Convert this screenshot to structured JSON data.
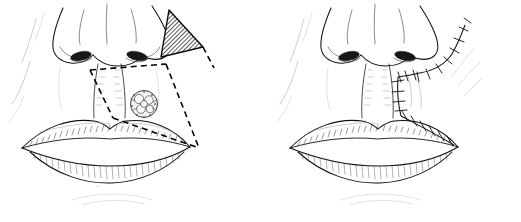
{
  "figure": {
    "type": "medical-surgical-illustration",
    "style": "black-and-white pen-and-ink line drawing",
    "background_color": "#ffffff",
    "ink_color": "#111111",
    "panel_count": 2,
    "dimensions": {
      "width": 521,
      "height": 222
    }
  },
  "panels": [
    {
      "id": "left",
      "label": "preoperative-plan",
      "caption": "",
      "description": "Frontal view of nose and lips with planned excision marked by dashed lines and a cross-hatched triangular flap",
      "anatomy": {
        "nose": "nasal tip, alae and columella with nostrils",
        "lips": "upper and lower vermillion with philtrum",
        "cheek": "right nasolabial fold"
      },
      "annotations": [
        {
          "name": "lesion",
          "kind": "skin-lesion",
          "shape": "irregular nodular lobulated mass",
          "location": "right upper cutaneous lip",
          "fill": "#f2f2f2"
        },
        {
          "name": "excision-outline",
          "kind": "dashed-incision-line",
          "shape": "triangular / quadrilateral excision boundary around the lesion",
          "stroke": "#000000",
          "line_style": "dashed"
        },
        {
          "name": "flap",
          "kind": "cross-hatched-flap",
          "shape": "triangle at the right alar base",
          "fill_pattern": "diagonal cross-hatch",
          "fill": "#3a3a3a"
        }
      ]
    },
    {
      "id": "right",
      "label": "postoperative-result",
      "caption": "",
      "description": "Frontal view after closure with interrupted sutures along the perialar, vertical lip and vermillion closure lines",
      "anatomy": {
        "nose": "nasal tip, alae and columella with nostrils",
        "lips": "upper and lower vermillion with philtrum",
        "cheek": "right cheek with contour strokes"
      },
      "annotations": [
        {
          "name": "perialar-suture-line",
          "kind": "suture-line",
          "shape": "curved line around the right alar rim",
          "stroke": "#111111"
        },
        {
          "name": "vertical-suture-line",
          "kind": "suture-line",
          "shape": "vertical line from alar base to upper lip",
          "stroke": "#111111"
        },
        {
          "name": "vermillion-suture-line",
          "kind": "suture-line",
          "shape": "oblique line along the right vermillion border to the oral commissure",
          "stroke": "#111111"
        }
      ]
    }
  ]
}
